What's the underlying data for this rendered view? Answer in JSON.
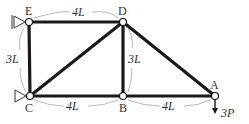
{
  "figure": {
    "type": "truss",
    "nodes": [
      {
        "id": "E",
        "label": "E",
        "support": "pin"
      },
      {
        "id": "D",
        "label": "D",
        "support": "none"
      },
      {
        "id": "C",
        "label": "C",
        "support": "roller"
      },
      {
        "id": "B",
        "label": "B",
        "support": "none"
      },
      {
        "id": "A",
        "label": "A",
        "support": "none"
      }
    ],
    "members": [
      [
        "E",
        "D"
      ],
      [
        "E",
        "C"
      ],
      [
        "C",
        "D"
      ],
      [
        "D",
        "B"
      ],
      [
        "C",
        "B"
      ],
      [
        "B",
        "A"
      ],
      [
        "D",
        "A"
      ]
    ],
    "dimensions": {
      "ED": "4L",
      "EC": "3L",
      "DB": "3L",
      "CB": "4L",
      "BA": "4L"
    },
    "load": {
      "node": "A",
      "direction": "down",
      "label": "3P"
    }
  }
}
